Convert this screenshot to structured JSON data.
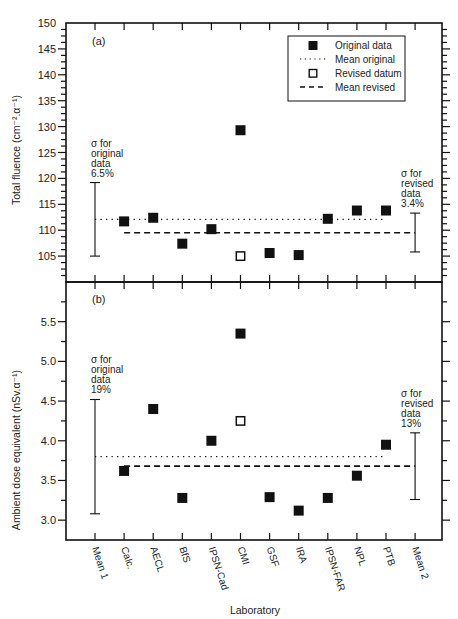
{
  "chart_data": [
    {
      "type": "scatter",
      "panel_label": "(a)",
      "title": "",
      "xlabel": "Laboratory",
      "ylabel": "Total fluence (cm⁻².α⁻¹)",
      "ylim": [
        100,
        150
      ],
      "yticks": [
        105,
        110,
        115,
        120,
        125,
        130,
        135,
        140,
        145,
        150
      ],
      "categories": [
        "Mean 1",
        "Calc.",
        "AECL",
        "BfS",
        "IPSN-Cad",
        "CMI",
        "GSF",
        "IRA",
        "IPSN-FAR",
        "NPL",
        "PTB",
        "Mean 2"
      ],
      "series": [
        {
          "name": "Original data",
          "marker": "filled-square",
          "points": [
            {
              "x": "Calc.",
              "y": 111.7
            },
            {
              "x": "AECL",
              "y": 112.4
            },
            {
              "x": "BfS",
              "y": 107.4
            },
            {
              "x": "IPSN-Cad",
              "y": 110.2
            },
            {
              "x": "CMI",
              "y": 129.3
            },
            {
              "x": "GSF",
              "y": 105.6
            },
            {
              "x": "IRA",
              "y": 105.2
            },
            {
              "x": "IPSN-FAR",
              "y": 112.2
            },
            {
              "x": "NPL",
              "y": 113.8
            },
            {
              "x": "PTB",
              "y": 113.8
            }
          ]
        },
        {
          "name": "Revised datum",
          "marker": "open-square",
          "points": [
            {
              "x": "CMI",
              "y": 105.0
            }
          ]
        }
      ],
      "mean_lines": [
        {
          "name": "Mean original",
          "style": "dotted",
          "y": 112.1,
          "from": "Mean 1",
          "to": "PTB"
        },
        {
          "name": "Mean revised",
          "style": "dashed",
          "y": 109.5,
          "from": "Calc.",
          "to": "Mean 2"
        }
      ],
      "error_bars": [
        {
          "x": "Mean 1",
          "low": 105.0,
          "high": 119.2,
          "label_lines": [
            "σ for",
            "original",
            "data",
            "6.5%"
          ]
        },
        {
          "x": "Mean 2",
          "low": 105.8,
          "high": 113.3,
          "label_lines": [
            "σ for",
            "revised",
            "data",
            "3.4%"
          ]
        }
      ],
      "legend": {
        "position": "upper-right",
        "entries": [
          "Original data",
          "Mean original",
          "Revised datum",
          "Mean revised"
        ]
      },
      "grid": false
    },
    {
      "type": "scatter",
      "panel_label": "(b)",
      "title": "",
      "xlabel": "Laboratory",
      "ylabel": "Ambient dose equivalent (nSv.α⁻¹)",
      "ylim": [
        2.75,
        6.0
      ],
      "yticks": [
        3.0,
        3.5,
        4.0,
        4.5,
        5.0,
        5.5
      ],
      "categories": [
        "Mean 1",
        "Calc.",
        "AECL",
        "BfS",
        "IPSN-Cad",
        "CMI",
        "GSF",
        "IRA",
        "IPSN-FAR",
        "NPL",
        "PTB",
        "Mean 2"
      ],
      "series": [
        {
          "name": "Original data",
          "marker": "filled-square",
          "points": [
            {
              "x": "Calc.",
              "y": 3.62
            },
            {
              "x": "AECL",
              "y": 4.4
            },
            {
              "x": "BfS",
              "y": 3.28
            },
            {
              "x": "IPSN-Cad",
              "y": 4.0
            },
            {
              "x": "CMI",
              "y": 5.35
            },
            {
              "x": "GSF",
              "y": 3.29
            },
            {
              "x": "IRA",
              "y": 3.12
            },
            {
              "x": "IPSN-FAR",
              "y": 3.28
            },
            {
              "x": "NPL",
              "y": 3.56
            },
            {
              "x": "PTB",
              "y": 3.95
            }
          ]
        },
        {
          "name": "Revised datum",
          "marker": "open-square",
          "points": [
            {
              "x": "CMI",
              "y": 4.25
            }
          ]
        }
      ],
      "mean_lines": [
        {
          "name": "Mean original",
          "style": "dotted",
          "y": 3.8,
          "from": "Mean 1",
          "to": "PTB"
        },
        {
          "name": "Mean revised",
          "style": "dashed",
          "y": 3.68,
          "from": "Calc.",
          "to": "Mean 2"
        }
      ],
      "error_bars": [
        {
          "x": "Mean 1",
          "low": 3.08,
          "high": 4.52,
          "label_lines": [
            "σ for",
            "original",
            "data",
            "19%"
          ]
        },
        {
          "x": "Mean 2",
          "low": 3.26,
          "high": 4.1,
          "label_lines": [
            "σ for",
            "revised",
            "data",
            "13%"
          ]
        }
      ],
      "grid": false
    }
  ],
  "legend_labels": {
    "original": "Original data",
    "mean_original": "Mean original",
    "revised": "Revised datum",
    "mean_revised": "Mean revised"
  },
  "colors": {
    "ink": "#111111",
    "text": "#222222",
    "background": "#ffffff"
  }
}
